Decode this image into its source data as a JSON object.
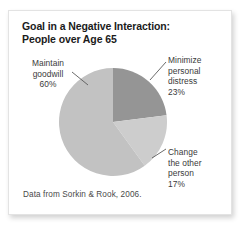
{
  "figure": {
    "title_line_1": "Goal in a Negative Interaction:",
    "title_line_2": "People over Age 65",
    "source_note": "Data from Sorkin & Rook, 2006.",
    "card_background": "#ffffff",
    "page_background": "#ffffff",
    "text_color": "#3a3a3a",
    "title_color": "#1b1b1b",
    "leader_line_color": "#5a5a5a"
  },
  "labels": {
    "goodwill": {
      "line_1": "Maintain",
      "line_2": "goodwill",
      "line_3": "60%"
    },
    "distress": {
      "line_1": "Minimize",
      "line_2": "personal",
      "line_3": "distress",
      "line_4": "23%"
    },
    "change": {
      "line_1": "Change",
      "line_2": "the other",
      "line_3": "person",
      "line_4": "17%"
    }
  },
  "chart_data": {
    "type": "pie",
    "title": "Goal in a Negative Interaction: People over Age 65",
    "subtitle": "",
    "xlabel": "",
    "ylabel": "",
    "legend_position": "callout-labels",
    "grid": false,
    "start_angle_deg": 0,
    "direction": "clockwise",
    "units": "percent",
    "categories": [
      "Minimize personal distress",
      "Change the other person",
      "Maintain goodwill"
    ],
    "values": [
      23,
      17,
      60
    ],
    "colors": [
      "#959595",
      "#cdcdcd",
      "#c2c2c2"
    ],
    "slices": [
      {
        "label": "Minimize personal distress",
        "value": 23,
        "value_text": "23%",
        "color": "#959595",
        "start_angle_deg": 0,
        "end_angle_deg": 82.8
      },
      {
        "label": "Change the other person",
        "value": 17,
        "value_text": "17%",
        "color": "#cdcdcd",
        "start_angle_deg": 82.8,
        "end_angle_deg": 144.0
      },
      {
        "label": "Maintain goodwill",
        "value": 60,
        "value_text": "60%",
        "color": "#c2c2c2",
        "start_angle_deg": 144.0,
        "end_angle_deg": 360.0
      }
    ],
    "source": "Data from Sorkin & Rook, 2006."
  }
}
